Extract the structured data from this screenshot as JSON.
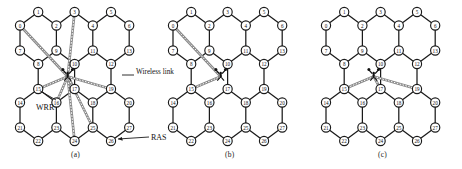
{
  "figure": {
    "panels": [
      {
        "id": "a",
        "caption": "(a)",
        "annotations": [
          {
            "name": "wireless-link-label",
            "text": "Wireless link"
          },
          {
            "name": "wrr-label",
            "text": "WRR"
          },
          {
            "name": "ras-label",
            "text": "RAS"
          }
        ],
        "wireless_links_from_hub_to_nodes": [
          0,
          3,
          15,
          16,
          17,
          19,
          24,
          25
        ],
        "hub_name": "wireless-router-antenna"
      },
      {
        "id": "b",
        "caption": "(b)",
        "annotations": [],
        "wireless_links_from_hub_to_nodes": [
          0,
          15
        ],
        "hub_name": "wireless-router-antenna"
      },
      {
        "id": "c",
        "caption": "(c)",
        "annotations": [],
        "wireless_links_from_hub_to_nodes": [
          15,
          17,
          19
        ],
        "hub_name": "wireless-router-antenna"
      }
    ],
    "node_labels": [
      "0",
      "1",
      "2",
      "3",
      "4",
      "5",
      "6",
      "7",
      "8",
      "9",
      "10",
      "11",
      "12",
      "13",
      "14",
      "15",
      "16",
      "17",
      "18",
      "19",
      "20",
      "21",
      "22",
      "23",
      "24",
      "25",
      "26",
      "27"
    ],
    "colors": {
      "node_fill": "#ffffff",
      "node_stroke": "#1a1a1a",
      "wired_link": "#1a1a1a",
      "wireless_link": "#555555",
      "text": "#111111"
    }
  }
}
